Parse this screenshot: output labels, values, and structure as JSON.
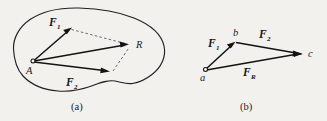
{
  "figure": {
    "background_color": "#f2f1ee",
    "ink_color": "#131215",
    "dashed_color": "#55535a",
    "panels": [
      {
        "id": "a",
        "caption": "(a)",
        "description": "Parallelogram law of force addition on a rigid body",
        "origin_label": "A",
        "resultant_label": "R",
        "vectors": [
          {
            "name": "F1",
            "base": "F",
            "subscript": "1",
            "style": "solid",
            "from": "A",
            "to": "F1-tip"
          },
          {
            "name": "F2",
            "base": "F",
            "subscript": "2",
            "style": "solid",
            "from": "A",
            "to": "F2-tip"
          },
          {
            "name": "R",
            "base": "R",
            "subscript": "",
            "style": "solid",
            "from": "A",
            "to": "R"
          }
        ],
        "construction_lines": [
          {
            "style": "dashed",
            "from": "F1-tip",
            "to": "R"
          },
          {
            "style": "dashed",
            "from": "F2-tip",
            "to": "R"
          }
        ]
      },
      {
        "id": "b",
        "caption": "(b)",
        "description": "Triangle law of force addition",
        "points": [
          "a",
          "b",
          "c"
        ],
        "vectors": [
          {
            "name": "F1",
            "base": "F",
            "subscript": "1",
            "style": "solid",
            "from": "a",
            "to": "b"
          },
          {
            "name": "F2",
            "base": "F",
            "subscript": "2",
            "style": "solid",
            "from": "b",
            "to": "c"
          },
          {
            "name": "FR",
            "base": "F",
            "subscript": "R",
            "style": "solid",
            "from": "a",
            "to": "c"
          }
        ]
      }
    ]
  },
  "labels": {
    "panel_a": {
      "f1": "F",
      "f1_sub": "1",
      "f2": "F",
      "f2_sub": "2",
      "resultant": "R",
      "origin": "A",
      "caption": "(a)"
    },
    "panel_b": {
      "f1": "F",
      "f1_sub": "1",
      "f2": "F",
      "f2_sub": "2",
      "fr": "F",
      "fr_sub": "R",
      "point_a": "a",
      "point_b": "b",
      "point_c": "c",
      "caption": "(b)"
    }
  }
}
